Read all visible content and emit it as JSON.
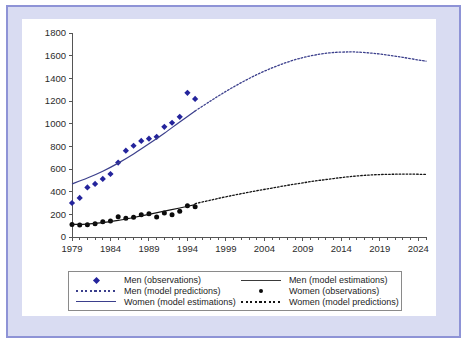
{
  "figure": {
    "frame_color": "#d9dcf2",
    "frame_border_color": "#8e93d6",
    "panel_color": "#ffffff"
  },
  "chart_data": {
    "type": "line",
    "title": "",
    "xlabel": "",
    "ylabel": "",
    "xlim": [
      1979,
      2025
    ],
    "ylim": [
      0,
      1800
    ],
    "grid": false,
    "legend_position": "bottom",
    "y_ticks": [
      0,
      200,
      400,
      600,
      800,
      1000,
      1200,
      1400,
      1600,
      1800
    ],
    "y_tick_labels": [
      "0",
      "200",
      "400",
      "600",
      "800",
      "1000",
      "1200",
      "1400",
      "1600",
      "1800"
    ],
    "x_ticks": [
      1979,
      1984,
      1989,
      1994,
      1999,
      2004,
      2009,
      2014,
      2019,
      2024
    ],
    "x_tick_labels": [
      "1979",
      "1984",
      "1989",
      "1994",
      "1999",
      "2004",
      "2009",
      "2014",
      "2019",
      "2024"
    ],
    "x_minor_tick_interval": 1,
    "series": [
      {
        "name": "Men (observations)",
        "style": "markers",
        "marker": "diamond",
        "color": "#24249c",
        "x": [
          1979,
          1980,
          1981,
          1982,
          1983,
          1984,
          1985,
          1986,
          1987,
          1988,
          1989,
          1990,
          1991,
          1992,
          1993,
          1994,
          1995
        ],
        "values": [
          300,
          345,
          437,
          468,
          512,
          556,
          657,
          762,
          805,
          848,
          868,
          884,
          972,
          1008,
          1060,
          1272,
          1218
        ]
      },
      {
        "name": "Men (model estimations)",
        "style": "solid-line",
        "color": "#3b3f8c",
        "x": [
          1979,
          1981,
          1983,
          1985,
          1987,
          1989,
          1991,
          1993,
          1995
        ],
        "values": [
          468,
          520,
          580,
          652,
          733,
          822,
          916,
          1015,
          1112
        ]
      },
      {
        "name": "Men (model predictions)",
        "style": "dotted-line",
        "color": "#3b3f8c",
        "x": [
          1995,
          1997,
          1999,
          2001,
          2003,
          2005,
          2007,
          2009,
          2011,
          2013,
          2015,
          2016,
          2018,
          2020,
          2022,
          2024,
          2025
        ],
        "values": [
          1112,
          1200,
          1285,
          1362,
          1432,
          1492,
          1543,
          1583,
          1611,
          1628,
          1633,
          1632,
          1622,
          1606,
          1585,
          1562,
          1552
        ]
      },
      {
        "name": "Women (observations)",
        "style": "markers",
        "marker": "circle",
        "color": "#0b0b0b",
        "x": [
          1979,
          1980,
          1981,
          1982,
          1983,
          1984,
          1985,
          1986,
          1987,
          1988,
          1989,
          1990,
          1991,
          1992,
          1993,
          1994,
          1995
        ],
        "values": [
          110,
          105,
          108,
          116,
          134,
          142,
          178,
          166,
          174,
          196,
          205,
          176,
          212,
          196,
          228,
          276,
          266
        ]
      },
      {
        "name": "Women (model estimations)",
        "style": "solid-line",
        "color": "#141414",
        "x": [
          1979,
          1981,
          1983,
          1985,
          1987,
          1989,
          1991,
          1993,
          1995
        ],
        "values": [
          112,
          114,
          126,
          146,
          172,
          200,
          228,
          256,
          285
        ]
      },
      {
        "name": "Women (model predictions)",
        "style": "dotted-line",
        "color": "#141414",
        "x": [
          1995,
          1997,
          1999,
          2001,
          2003,
          2005,
          2007,
          2009,
          2011,
          2013,
          2015,
          2017,
          2019,
          2021,
          2023,
          2025
        ],
        "values": [
          295,
          325,
          355,
          382,
          408,
          432,
          456,
          478,
          498,
          516,
          532,
          544,
          551,
          554,
          555,
          552
        ]
      }
    ]
  },
  "legend": {
    "entries": [
      {
        "label": "Men (observations)",
        "key": "diamond-blue-icon"
      },
      {
        "label": "Men (model estimations)",
        "key": "solid-line-black-icon"
      },
      {
        "label": "Men (model predictions)",
        "key": "dotted-line-blue-icon"
      },
      {
        "label": "Women (observations)",
        "key": "dot-black-icon"
      },
      {
        "label": "Women (model estimations)",
        "key": "solid-line-blue-icon"
      },
      {
        "label": "Women (model predictions)",
        "key": "dotted-line-black-icon"
      }
    ]
  }
}
